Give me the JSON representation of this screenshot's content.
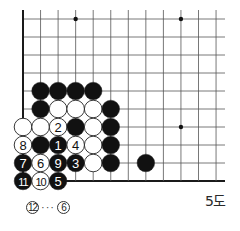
{
  "diagram": {
    "caption": "5도",
    "board": {
      "origin": {
        "x": 23,
        "y": 19
      },
      "spacing": {
        "x": 17.55,
        "y": 18
      },
      "columns": 12,
      "rows": 10,
      "vertical_line_top": 10,
      "horizontal_line_right": 225,
      "left_edge_thick": true,
      "bottom_edge_thick": true,
      "stone_radius": 8.8,
      "line_color": "#555555",
      "edge_color": "#1a1a1a",
      "black_color": "#111111",
      "white_color": "#ffffff"
    },
    "star_points": [
      {
        "col": 3,
        "row": 0
      },
      {
        "col": 9,
        "row": 0
      },
      {
        "col": 9,
        "row": 6
      }
    ],
    "stones": [
      {
        "col": 1,
        "row": 4,
        "color": "black",
        "label": ""
      },
      {
        "col": 2,
        "row": 4,
        "color": "black",
        "label": ""
      },
      {
        "col": 3,
        "row": 4,
        "color": "black",
        "label": ""
      },
      {
        "col": 4,
        "row": 4,
        "color": "black",
        "label": ""
      },
      {
        "col": 1,
        "row": 5,
        "color": "black",
        "label": ""
      },
      {
        "col": 2,
        "row": 5,
        "color": "white",
        "label": ""
      },
      {
        "col": 3,
        "row": 5,
        "color": "white",
        "label": ""
      },
      {
        "col": 4,
        "row": 5,
        "color": "white",
        "label": ""
      },
      {
        "col": 5,
        "row": 5,
        "color": "black",
        "label": ""
      },
      {
        "col": 0,
        "row": 6,
        "color": "white",
        "label": ""
      },
      {
        "col": 1,
        "row": 6,
        "color": "white",
        "label": ""
      },
      {
        "col": 2,
        "row": 6,
        "color": "white",
        "label": "2"
      },
      {
        "col": 3,
        "row": 6,
        "color": "black",
        "label": ""
      },
      {
        "col": 4,
        "row": 6,
        "color": "white",
        "label": ""
      },
      {
        "col": 5,
        "row": 6,
        "color": "black",
        "label": ""
      },
      {
        "col": 0,
        "row": 7,
        "color": "white",
        "label": "8"
      },
      {
        "col": 1,
        "row": 7,
        "color": "black",
        "label": ""
      },
      {
        "col": 2,
        "row": 7,
        "color": "black",
        "label": "1"
      },
      {
        "col": 3,
        "row": 7,
        "color": "white",
        "label": "4"
      },
      {
        "col": 4,
        "row": 7,
        "color": "white",
        "label": ""
      },
      {
        "col": 5,
        "row": 7,
        "color": "black",
        "label": ""
      },
      {
        "col": 0,
        "row": 8,
        "color": "black",
        "label": "7"
      },
      {
        "col": 1,
        "row": 8,
        "color": "white",
        "label": "6"
      },
      {
        "col": 2,
        "row": 8,
        "color": "black",
        "label": "9"
      },
      {
        "col": 3,
        "row": 8,
        "color": "black",
        "label": "3"
      },
      {
        "col": 4,
        "row": 8,
        "color": "white",
        "label": ""
      },
      {
        "col": 5,
        "row": 8,
        "color": "black",
        "label": ""
      },
      {
        "col": 7,
        "row": 8,
        "color": "black",
        "label": ""
      },
      {
        "col": 0,
        "row": 9,
        "color": "black",
        "label": "11"
      },
      {
        "col": 1,
        "row": 9,
        "color": "white",
        "label": "10"
      },
      {
        "col": 2,
        "row": 9,
        "color": "black",
        "label": "5"
      }
    ],
    "note": {
      "move": "12",
      "separator": "···",
      "at": "6"
    }
  }
}
